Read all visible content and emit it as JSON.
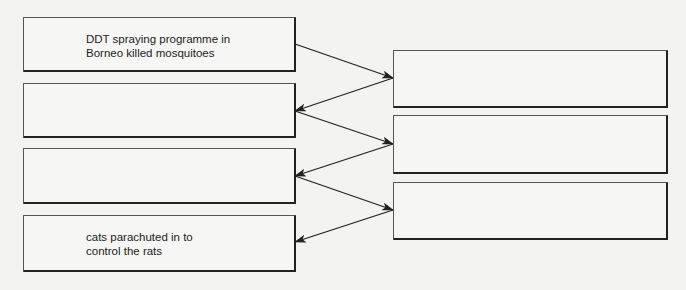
{
  "diagram": {
    "type": "flow-chain-fill-in",
    "left_boxes": [
      {
        "id": "L1",
        "text": "DDT spraying programme in\nBorneo killed mosquitoes"
      },
      {
        "id": "L2",
        "text": ""
      },
      {
        "id": "L3",
        "text": ""
      },
      {
        "id": "L4",
        "text": "cats parachuted in to\ncontrol the rats"
      }
    ],
    "right_boxes": [
      {
        "id": "R1",
        "text": ""
      },
      {
        "id": "R2",
        "text": ""
      },
      {
        "id": "R3",
        "text": ""
      }
    ],
    "arrows": [
      {
        "from": "L1",
        "to": "R1"
      },
      {
        "from": "R1",
        "to": "L2"
      },
      {
        "from": "L2",
        "to": "R2"
      },
      {
        "from": "R2",
        "to": "L3"
      },
      {
        "from": "L3",
        "to": "R3"
      },
      {
        "from": "R3",
        "to": "L4"
      }
    ],
    "line_color": "#222222"
  }
}
